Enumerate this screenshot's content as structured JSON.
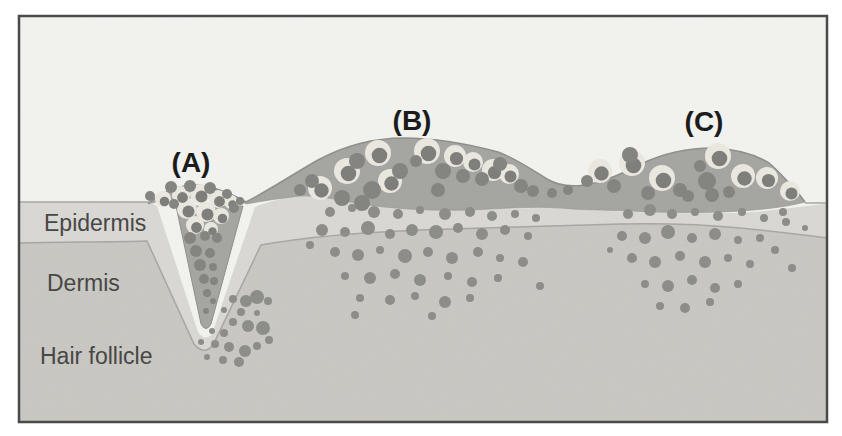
{
  "figure": {
    "panels": [
      {
        "id": "A",
        "label": "(A)"
      },
      {
        "id": "B",
        "label": "(B)"
      },
      {
        "id": "C",
        "label": "(C)"
      }
    ],
    "layers": [
      {
        "name": "Epidermis"
      },
      {
        "name": "Dermis"
      },
      {
        "name": "Hair follicle"
      }
    ],
    "colors": {
      "page_background": "#ffffff",
      "panel_background": "#f3f3f0",
      "epidermis_fill": "#d9d8d4",
      "dermis_fill": "#c8c7c2",
      "lesion_fill": "#a4a4a1",
      "cell_dot": "#8b8b88",
      "cell_halo": "#ebe8e0",
      "cell_nucleus": "#7c7c79",
      "frame_border": "#4a4a48",
      "layer_label_text": "#434341",
      "panel_label_text": "#161616"
    }
  }
}
